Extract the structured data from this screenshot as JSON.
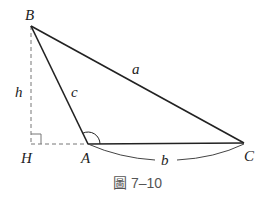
{
  "diagram": {
    "vertices": {
      "B": "B",
      "H": "H",
      "A": "A",
      "C": "C"
    },
    "sides": {
      "a": "a",
      "b": "b",
      "c": "c",
      "h": "h"
    },
    "caption": "圖 7–10",
    "colors": {
      "line": "#222222",
      "dashed": "#777777",
      "caption": "#555555"
    }
  }
}
